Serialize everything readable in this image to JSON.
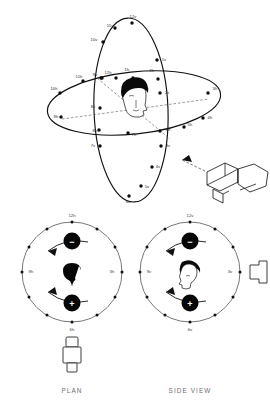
{
  "figure": {
    "title_visible": false,
    "background_color": "#ffffff",
    "ink_color": "#111111"
  },
  "main_diagram": {
    "name": "three-dimensional clock-position diagram",
    "subject": "patient head at centre of two orthogonal orientation rings",
    "horizontal_ring": {
      "label_suffix": "h",
      "positions": [
        {
          "id": "12h",
          "label": "12h",
          "x": 108,
          "y": 74
        },
        {
          "id": "1h",
          "label": "1h",
          "x": 125,
          "y": 71
        },
        {
          "id": "2h",
          "label": "2h",
          "x": 150,
          "y": 72
        },
        {
          "id": "3h",
          "label": "3h",
          "x": 213,
          "y": 89
        },
        {
          "id": "4h",
          "label": "4h",
          "x": 210,
          "y": 117
        },
        {
          "id": "5h",
          "label": "5h",
          "x": 190,
          "y": 128
        },
        {
          "id": "6h",
          "label": "6h",
          "x": 165,
          "y": 133
        },
        {
          "id": "7h",
          "label": "7h",
          "x": 134,
          "y": 136
        },
        {
          "id": "8h",
          "label": "8h",
          "x": 95,
          "y": 133
        },
        {
          "id": "9h",
          "label": "9h",
          "x": 57,
          "y": 117
        },
        {
          "id": "10h",
          "label": "10h",
          "x": 56,
          "y": 90
        },
        {
          "id": "11h",
          "label": "11h",
          "x": 79,
          "y": 78
        }
      ]
    },
    "vertical_ring": {
      "label_suffix": "v",
      "positions": [
        {
          "id": "12v",
          "label": "12v",
          "x": 131,
          "y": 18
        },
        {
          "id": "1v",
          "label": "1v",
          "x": 162,
          "y": 60
        },
        {
          "id": "2v",
          "label": "2v",
          "x": 165,
          "y": 93
        },
        {
          "id": "3v",
          "label": "3v",
          "x": 166,
          "y": 146
        },
        {
          "id": "4v",
          "label": "4v",
          "x": 156,
          "y": 167
        },
        {
          "id": "5v",
          "label": "5v",
          "x": 145,
          "y": 188
        },
        {
          "id": "6v",
          "label": "6v",
          "x": 127,
          "y": 201
        },
        {
          "id": "7v",
          "label": "7v",
          "x": 94,
          "y": 145
        },
        {
          "id": "8v",
          "label": "8v",
          "x": 94,
          "y": 107
        },
        {
          "id": "9v",
          "label": "9v",
          "x": 96,
          "y": 74
        },
        {
          "id": "10v",
          "label": "10v",
          "x": 95,
          "y": 40
        },
        {
          "id": "11v",
          "label": "11v",
          "x": 110,
          "y": 26
        }
      ]
    },
    "x_ray_tube": {
      "name": "x-ray-tube",
      "pointing_at": "patient head",
      "arrow_direction": "up-left"
    }
  },
  "plan_view": {
    "caption": "PLAN",
    "caption_x": 72,
    "caption_y": 392,
    "centre_subject": "head viewed from above",
    "axis_labels": [
      {
        "id": "12h",
        "label": "12h",
        "x": 72,
        "y": 220
      },
      {
        "id": "3h",
        "label": "3h",
        "x": 110,
        "y": 272
      },
      {
        "id": "6h",
        "label": "6h",
        "x": 72,
        "y": 329
      },
      {
        "id": "9h",
        "label": "9h",
        "x": 24,
        "y": 272
      }
    ],
    "polarity_markers": [
      {
        "id": "negative",
        "symbol": "−",
        "position": "12 o'clock"
      },
      {
        "id": "positive",
        "symbol": "+",
        "position": "6 o'clock"
      }
    ],
    "tick_count": 12,
    "rotation_arrows": 2,
    "tube_icon_position": "bottom / 6h"
  },
  "side_view": {
    "caption": "SIDE VIEW",
    "caption_x": 182,
    "caption_y": 392,
    "centre_subject": "head profile facing right",
    "axis_labels": [
      {
        "id": "12v",
        "label": "12v",
        "x": 196,
        "y": 220
      },
      {
        "id": "3v",
        "label": "3v",
        "x": 235,
        "y": 272
      },
      {
        "id": "6v",
        "label": "6v",
        "x": 196,
        "y": 329
      },
      {
        "id": "9v",
        "label": "9v",
        "x": 148,
        "y": 272
      }
    ],
    "polarity_markers": [
      {
        "id": "negative",
        "symbol": "−",
        "position": "12 o'clock"
      },
      {
        "id": "positive",
        "symbol": "+",
        "position": "6 o'clock"
      }
    ],
    "tick_count": 12,
    "rotation_arrows": 2,
    "tube_icon_position": "right / 3v"
  }
}
